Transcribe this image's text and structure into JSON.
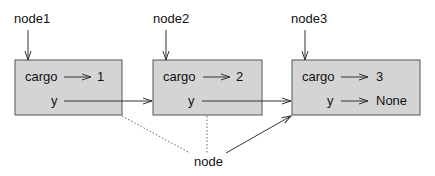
{
  "colors": {
    "box_fill": "#d4d4d4",
    "box_stroke": "#555555",
    "line": "#333333"
  },
  "nodes": [
    {
      "label": "node1",
      "cargo_label": "cargo",
      "cargo_value": "1",
      "next_label": "y",
      "next_value": ""
    },
    {
      "label": "node2",
      "cargo_label": "cargo",
      "cargo_value": "2",
      "next_label": "y",
      "next_value": ""
    },
    {
      "label": "node3",
      "cargo_label": "cargo",
      "cargo_value": "3",
      "next_label": "y",
      "next_value": "None"
    }
  ],
  "pointer": {
    "label": "node"
  }
}
